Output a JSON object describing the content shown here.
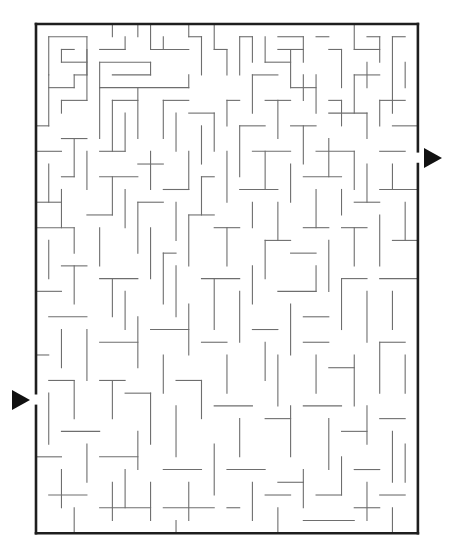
{
  "puzzle": {
    "type": "maze",
    "grid": {
      "cols": 30,
      "rows": 40,
      "origin_x": 36,
      "origin_y": 24,
      "cell": 12.73
    },
    "colors": {
      "wall": "#6e6e6e",
      "border": "#1e1e1e",
      "arrow": "#111111",
      "background": "#ffffff"
    },
    "entrance": {
      "side": "left",
      "row": 29,
      "arrow": "right-pointing-triangle"
    },
    "exit": {
      "side": "right",
      "row": 10,
      "arrow": "right-pointing-triangle"
    },
    "walls": [
      [
        1,
        1,
        1,
        4
      ],
      [
        1,
        1,
        4,
        1
      ],
      [
        4,
        1,
        4,
        4
      ],
      [
        4,
        3,
        2,
        3
      ],
      [
        2,
        2,
        2,
        3
      ],
      [
        2,
        2,
        3,
        2
      ],
      [
        1,
        4,
        1,
        8
      ],
      [
        1,
        5,
        3,
        5
      ],
      [
        3,
        4,
        3,
        5
      ],
      [
        3,
        4,
        4,
        4
      ],
      [
        2,
        6,
        4,
        6
      ],
      [
        2,
        6,
        2,
        7
      ],
      [
        0,
        8,
        1,
        8
      ],
      [
        6,
        0,
        6,
        1
      ],
      [
        5,
        2,
        7,
        2
      ],
      [
        7,
        2,
        7,
        1
      ],
      [
        8,
        0,
        8,
        1
      ],
      [
        9,
        0,
        9,
        2
      ],
      [
        9,
        2,
        12,
        2
      ],
      [
        10,
        1,
        10,
        2
      ],
      [
        12,
        0,
        12,
        1
      ],
      [
        12,
        1,
        13,
        1
      ],
      [
        13,
        1,
        13,
        4
      ],
      [
        4,
        2,
        4,
        6
      ],
      [
        5,
        3,
        5,
        5
      ],
      [
        5,
        3,
        9,
        3
      ],
      [
        9,
        3,
        9,
        4
      ],
      [
        6,
        4,
        9,
        4
      ],
      [
        5,
        5,
        5,
        9
      ],
      [
        5,
        5,
        12,
        5
      ],
      [
        12,
        4,
        12,
        5
      ],
      [
        8,
        5,
        8,
        9
      ],
      [
        6,
        6,
        8,
        6
      ],
      [
        6,
        6,
        6,
        10
      ],
      [
        7,
        7,
        7,
        10
      ],
      [
        14,
        0,
        14,
        2
      ],
      [
        14,
        2,
        15,
        2
      ],
      [
        15,
        2,
        15,
        4
      ],
      [
        16,
        1,
        17,
        1
      ],
      [
        16,
        1,
        16,
        4
      ],
      [
        17,
        1,
        17,
        3
      ],
      [
        18,
        1,
        18,
        3
      ],
      [
        18,
        3,
        20,
        3
      ],
      [
        19,
        1,
        21,
        1
      ],
      [
        21,
        1,
        21,
        3
      ],
      [
        22,
        1,
        23,
        1
      ],
      [
        23,
        2,
        24,
        2
      ],
      [
        24,
        2,
        24,
        5
      ],
      [
        19,
        2,
        21,
        2
      ],
      [
        20,
        2,
        20,
        5
      ],
      [
        20,
        5,
        22,
        5
      ],
      [
        22,
        4,
        22,
        7
      ],
      [
        21,
        4,
        21,
        6
      ],
      [
        17,
        4,
        19,
        4
      ],
      [
        17,
        4,
        17,
        7
      ],
      [
        25,
        0,
        25,
        2
      ],
      [
        25,
        2,
        27,
        2
      ],
      [
        26,
        1,
        27,
        1
      ],
      [
        27,
        1,
        27,
        3
      ],
      [
        28,
        1,
        29,
        1
      ],
      [
        28,
        1,
        28,
        7
      ],
      [
        29,
        3,
        29,
        5
      ],
      [
        26,
        3,
        26,
        5
      ],
      [
        25,
        4,
        27,
        4
      ],
      [
        25,
        4,
        25,
        7
      ],
      [
        23,
        6,
        24,
        6
      ],
      [
        24,
        6,
        24,
        8
      ],
      [
        23,
        7,
        26,
        7
      ],
      [
        26,
        7,
        26,
        9
      ],
      [
        27,
        6,
        29,
        6
      ],
      [
        27,
        6,
        27,
        8
      ],
      [
        28,
        8,
        30,
        8
      ],
      [
        18,
        6,
        20,
        6
      ],
      [
        19,
        6,
        19,
        9
      ],
      [
        15,
        6,
        16,
        6
      ],
      [
        15,
        6,
        15,
        8
      ],
      [
        10,
        6,
        12,
        6
      ],
      [
        10,
        6,
        10,
        9
      ],
      [
        11,
        7,
        11,
        10
      ],
      [
        12,
        7,
        14,
        7
      ],
      [
        14,
        7,
        14,
        10
      ],
      [
        13,
        8,
        13,
        11
      ],
      [
        16,
        8,
        18,
        8
      ],
      [
        16,
        8,
        16,
        12
      ],
      [
        20,
        8,
        22,
        8
      ],
      [
        21,
        8,
        21,
        11
      ],
      [
        2,
        9,
        4,
        9
      ],
      [
        3,
        9,
        3,
        12
      ],
      [
        0,
        10,
        2,
        10
      ],
      [
        4,
        10,
        4,
        13
      ],
      [
        1,
        11,
        1,
        14
      ],
      [
        5,
        10,
        7,
        10
      ],
      [
        9,
        10,
        9,
        13
      ],
      [
        8,
        11,
        10,
        11
      ],
      [
        12,
        10,
        12,
        13
      ],
      [
        15,
        10,
        15,
        14
      ],
      [
        17,
        10,
        20,
        10
      ],
      [
        18,
        10,
        18,
        13
      ],
      [
        20,
        11,
        20,
        14
      ],
      [
        22,
        10,
        25,
        10
      ],
      [
        23,
        9,
        23,
        12
      ],
      [
        25,
        10,
        25,
        13
      ],
      [
        27,
        10,
        29,
        10
      ],
      [
        26,
        11,
        26,
        14
      ],
      [
        28,
        11,
        28,
        13
      ],
      [
        2,
        12,
        3,
        12
      ],
      [
        2,
        13,
        2,
        16
      ],
      [
        0,
        14,
        2,
        14
      ],
      [
        5,
        12,
        8,
        12
      ],
      [
        6,
        12,
        6,
        15
      ],
      [
        7,
        13,
        7,
        16
      ],
      [
        10,
        13,
        12,
        13
      ],
      [
        11,
        14,
        11,
        17
      ],
      [
        13,
        12,
        14,
        12
      ],
      [
        13,
        12,
        13,
        15
      ],
      [
        16,
        13,
        19,
        13
      ],
      [
        17,
        14,
        17,
        16
      ],
      [
        19,
        14,
        19,
        17
      ],
      [
        21,
        12,
        24,
        12
      ],
      [
        22,
        13,
        22,
        16
      ],
      [
        24,
        13,
        24,
        15
      ],
      [
        27,
        13,
        30,
        13
      ],
      [
        25,
        14,
        27,
        14
      ],
      [
        29,
        14,
        29,
        17
      ],
      [
        0,
        16,
        3,
        16
      ],
      [
        3,
        16,
        3,
        18
      ],
      [
        1,
        17,
        1,
        20
      ],
      [
        4,
        15,
        6,
        15
      ],
      [
        5,
        16,
        5,
        19
      ],
      [
        8,
        14,
        10,
        14
      ],
      [
        8,
        14,
        8,
        18
      ],
      [
        9,
        16,
        9,
        20
      ],
      [
        12,
        15,
        14,
        15
      ],
      [
        12,
        15,
        12,
        19
      ],
      [
        14,
        16,
        16,
        16
      ],
      [
        15,
        16,
        15,
        19
      ],
      [
        18,
        17,
        20,
        17
      ],
      [
        18,
        17,
        18,
        20
      ],
      [
        21,
        16,
        23,
        16
      ],
      [
        20,
        18,
        22,
        18
      ],
      [
        23,
        17,
        23,
        21
      ],
      [
        24,
        16,
        26,
        16
      ],
      [
        25,
        16,
        25,
        19
      ],
      [
        27,
        15,
        27,
        19
      ],
      [
        28,
        17,
        30,
        17
      ],
      [
        2,
        19,
        4,
        19
      ],
      [
        3,
        19,
        3,
        22
      ],
      [
        0,
        21,
        2,
        21
      ],
      [
        5,
        20,
        8,
        20
      ],
      [
        6,
        20,
        6,
        23
      ],
      [
        7,
        21,
        7,
        24
      ],
      [
        10,
        18,
        11,
        18
      ],
      [
        10,
        18,
        10,
        22
      ],
      [
        11,
        19,
        11,
        23
      ],
      [
        13,
        20,
        16,
        20
      ],
      [
        14,
        20,
        14,
        24
      ],
      [
        16,
        21,
        16,
        25
      ],
      [
        17,
        19,
        17,
        22
      ],
      [
        19,
        21,
        22,
        21
      ],
      [
        20,
        22,
        20,
        26
      ],
      [
        21,
        23,
        23,
        23
      ],
      [
        22,
        19,
        22,
        21
      ],
      [
        24,
        20,
        26,
        20
      ],
      [
        24,
        20,
        24,
        24
      ],
      [
        26,
        21,
        26,
        25
      ],
      [
        27,
        20,
        30,
        20
      ],
      [
        28,
        21,
        28,
        24
      ],
      [
        1,
        23,
        4,
        23
      ],
      [
        2,
        24,
        2,
        27
      ],
      [
        4,
        24,
        4,
        28
      ],
      [
        0,
        26,
        1,
        26
      ],
      [
        5,
        25,
        8,
        25
      ],
      [
        8,
        23,
        8,
        27
      ],
      [
        9,
        24,
        12,
        24
      ],
      [
        12,
        22,
        12,
        26
      ],
      [
        10,
        26,
        10,
        29
      ],
      [
        13,
        25,
        15,
        25
      ],
      [
        15,
        26,
        15,
        29
      ],
      [
        17,
        24,
        19,
        24
      ],
      [
        18,
        25,
        18,
        28
      ],
      [
        19,
        26,
        19,
        30
      ],
      [
        21,
        25,
        23,
        25
      ],
      [
        22,
        26,
        22,
        29
      ],
      [
        23,
        27,
        25,
        27
      ],
      [
        25,
        26,
        25,
        30
      ],
      [
        27,
        25,
        29,
        25
      ],
      [
        27,
        25,
        27,
        29
      ],
      [
        29,
        26,
        29,
        29
      ],
      [
        1,
        28,
        3,
        28
      ],
      [
        3,
        28,
        3,
        31
      ],
      [
        1,
        29,
        1,
        33
      ],
      [
        5,
        28,
        7,
        28
      ],
      [
        6,
        28,
        6,
        31
      ],
      [
        7,
        29,
        9,
        29
      ],
      [
        9,
        29,
        9,
        33
      ],
      [
        11,
        28,
        13,
        28
      ],
      [
        13,
        28,
        13,
        31
      ],
      [
        11,
        30,
        11,
        34
      ],
      [
        14,
        30,
        17,
        30
      ],
      [
        16,
        31,
        16,
        34
      ],
      [
        18,
        31,
        20,
        31
      ],
      [
        20,
        30,
        20,
        34
      ],
      [
        21,
        30,
        24,
        30
      ],
      [
        23,
        31,
        23,
        35
      ],
      [
        24,
        32,
        26,
        32
      ],
      [
        26,
        30,
        26,
        33
      ],
      [
        27,
        31,
        29,
        31
      ],
      [
        28,
        32,
        28,
        36
      ],
      [
        2,
        32,
        5,
        32
      ],
      [
        4,
        33,
        4,
        36
      ],
      [
        0,
        34,
        2,
        34
      ],
      [
        2,
        35,
        2,
        38
      ],
      [
        5,
        34,
        8,
        34
      ],
      [
        7,
        35,
        7,
        38
      ],
      [
        6,
        36,
        6,
        39
      ],
      [
        8,
        32,
        8,
        35
      ],
      [
        10,
        35,
        13,
        35
      ],
      [
        12,
        36,
        12,
        39
      ],
      [
        14,
        33,
        14,
        37
      ],
      [
        15,
        35,
        18,
        35
      ],
      [
        17,
        36,
        17,
        39
      ],
      [
        19,
        36,
        21,
        36
      ],
      [
        21,
        35,
        21,
        38
      ],
      [
        22,
        37,
        24,
        37
      ],
      [
        24,
        34,
        24,
        37
      ],
      [
        25,
        35,
        27,
        35
      ],
      [
        26,
        36,
        26,
        39
      ],
      [
        27,
        37,
        29,
        37
      ],
      [
        29,
        33,
        29,
        36
      ],
      [
        1,
        37,
        4,
        37
      ],
      [
        3,
        38,
        3,
        40
      ],
      [
        5,
        38,
        9,
        38
      ],
      [
        9,
        36,
        9,
        39
      ],
      [
        10,
        38,
        14,
        38
      ],
      [
        11,
        39,
        11,
        40
      ],
      [
        15,
        38,
        16,
        38
      ],
      [
        18,
        37,
        20,
        37
      ],
      [
        19,
        38,
        19,
        40
      ],
      [
        21,
        39,
        25,
        39
      ],
      [
        25,
        38,
        27,
        38
      ],
      [
        28,
        38,
        28,
        40
      ]
    ]
  }
}
